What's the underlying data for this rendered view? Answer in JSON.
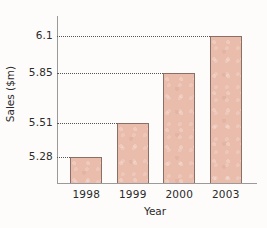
{
  "chart_data": {
    "type": "bar",
    "title": "",
    "xlabel": "Year",
    "ylabel": "Sales ($m)",
    "categories": [
      "1998",
      "1999",
      "2000",
      "2003"
    ],
    "values": [
      5.28,
      5.51,
      5.85,
      6.1
    ],
    "value_labels": [
      "5.28",
      "5.51",
      "5.85",
      "6.1"
    ],
    "ytick_labels": [
      "6.1",
      "5.85",
      "5.51",
      "5.28"
    ],
    "ytick_values": [
      6.1,
      5.85,
      5.51,
      5.28
    ],
    "ylim": [
      5.1,
      6.18
    ],
    "grid": "horizontal-dotted-to-bar-tops",
    "legend": "none",
    "series": [
      {
        "name": "Sales",
        "values": [
          5.28,
          5.51,
          5.85,
          6.1
        ]
      }
    ]
  },
  "style": {
    "bar_fill": "#e9bcab",
    "bar_border": "#8a6f66",
    "axis_color": "#9a9a9a",
    "grid_color": "#555555",
    "text_color": "#2b2b2b",
    "background": "#fdfcfa"
  }
}
